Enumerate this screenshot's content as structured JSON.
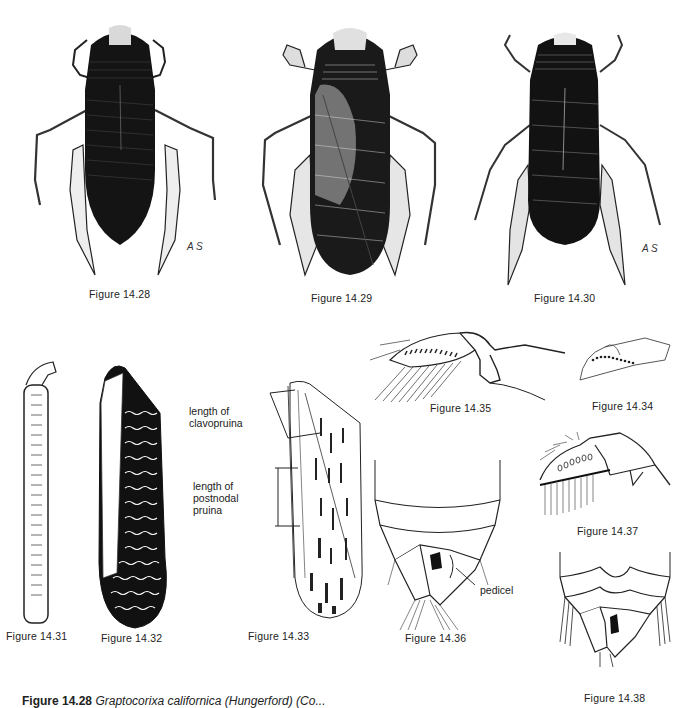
{
  "figures": [
    {
      "id": "14.28",
      "caption": "Figure 14.28",
      "subject": "water boatman dorsal view, dark",
      "signature": "A.S."
    },
    {
      "id": "14.29",
      "caption": "Figure 14.29",
      "subject": "water boatman dorsal view, mottled"
    },
    {
      "id": "14.30",
      "caption": "Figure 14.30",
      "subject": "water boatman dorsal view, dark",
      "signature": "A.S."
    },
    {
      "id": "14.31",
      "caption": "Figure 14.31",
      "subject": "palette with pegs"
    },
    {
      "id": "14.32",
      "caption": "Figure 14.32",
      "subject": "hemelytron, dark with wavy pale lines"
    },
    {
      "id": "14.33",
      "caption": "Figure 14.33",
      "subject": "hemelytron with measurement annotations"
    },
    {
      "id": "14.34",
      "caption": "Figure 14.34",
      "subject": "leg segment with peg row"
    },
    {
      "id": "14.35",
      "caption": "Figure 14.35",
      "subject": "foreleg with setae"
    },
    {
      "id": "14.36",
      "caption": "Figure 14.36",
      "subject": "abdomen ventral, genital segments"
    },
    {
      "id": "14.37",
      "caption": "Figure 14.37",
      "subject": "leg segment with pegs and setae"
    },
    {
      "id": "14.38",
      "caption": "Figure 14.38",
      "subject": "abdomen ventral, genital segments"
    }
  ],
  "annotations": {
    "clavopruina": "length of\nclavopruina",
    "postnodal": "length of\npostnodal\npruina",
    "pedicel": "pedicel"
  },
  "signature": "A S",
  "bottom_caption": {
    "label": "Figure 14.28",
    "text": "Graptocorixa californica (Hungerford) (Co..."
  }
}
